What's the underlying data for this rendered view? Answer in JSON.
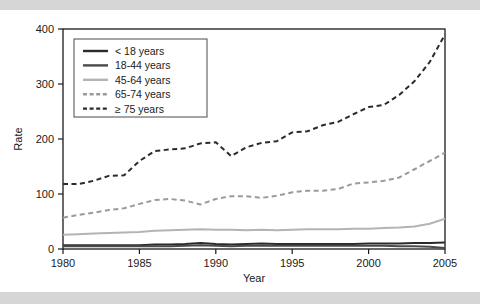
{
  "figure": {
    "y_axis_title": "Rate",
    "x_axis_title": "Year",
    "y_ticks": [
      "0",
      "100",
      "200",
      "300",
      "400"
    ],
    "x_ticks": [
      "1980",
      "1985",
      "1990",
      "1995",
      "2000",
      "2005"
    ]
  },
  "legend": {
    "items": [
      {
        "label": "< 18 years",
        "style": "solid",
        "color": "#2b2b2b"
      },
      {
        "label": "18-44 years",
        "style": "solid",
        "color": "#4a4a4a"
      },
      {
        "label": "45-64 years",
        "style": "solid",
        "color": "#b4b4b4"
      },
      {
        "label": "65-74 years",
        "style": "dashed",
        "color": "#9a9a9a"
      },
      {
        "label": "≥ 75 years",
        "style": "dashed",
        "color": "#2b2b2b"
      }
    ]
  },
  "colors": {
    "background": "#ffffff",
    "band": "#d6d6d6",
    "axis": "#1a1a1a",
    "dark_line": "#2b2b2b",
    "mid_line": "#4a4a4a",
    "light_line": "#b4b4b4",
    "gray_dash": "#9a9a9a"
  },
  "chart_data": {
    "type": "line",
    "title": "",
    "xlabel": "Year",
    "ylabel": "Rate",
    "xlim": [
      1980,
      2005
    ],
    "ylim": [
      0,
      400
    ],
    "grid": false,
    "legend_position": "top-left",
    "x": [
      1980,
      1981,
      1982,
      1983,
      1984,
      1985,
      1986,
      1987,
      1988,
      1989,
      1990,
      1991,
      1992,
      1993,
      1994,
      1995,
      1996,
      1997,
      1998,
      1999,
      2000,
      2001,
      2002,
      2003,
      2004,
      2005
    ],
    "series": [
      {
        "name": "< 18 years",
        "style": "solid",
        "color": "#2b2b2b",
        "values": [
          7,
          7,
          7,
          7,
          7,
          7,
          8,
          8,
          9,
          11,
          9,
          8,
          9,
          10,
          9,
          9,
          9,
          9,
          9,
          9,
          10,
          10,
          10,
          11,
          11,
          12
        ]
      },
      {
        "name": "18-44 years",
        "style": "solid",
        "color": "#4a4a4a",
        "values": [
          5,
          5,
          5,
          5,
          5,
          5,
          5,
          5,
          6,
          7,
          6,
          5,
          6,
          6,
          6,
          6,
          6,
          6,
          6,
          6,
          6,
          6,
          5,
          5,
          4,
          2
        ]
      },
      {
        "name": "45-64 years",
        "style": "solid",
        "color": "#b4b4b4",
        "values": [
          26,
          27,
          28,
          29,
          30,
          31,
          33,
          34,
          35,
          36,
          35,
          35,
          34,
          35,
          34,
          35,
          36,
          36,
          36,
          37,
          37,
          38,
          39,
          41,
          46,
          55
        ]
      },
      {
        "name": "65-74 years",
        "style": "dashed",
        "color": "#9a9a9a",
        "values": [
          57,
          62,
          66,
          71,
          74,
          82,
          89,
          91,
          88,
          81,
          91,
          96,
          96,
          93,
          97,
          103,
          106,
          106,
          109,
          110,
          114,
          116,
          117,
          119,
          121,
          117
        ]
      },
      {
        "name": "≥ 75 years",
        "style": "dashed",
        "color": "#2b2b2b",
        "values": [
          118,
          118,
          124,
          133,
          134,
          160,
          178,
          181,
          183,
          192,
          194,
          169,
          185,
          193,
          196,
          212,
          214,
          207,
          211,
          216,
          213,
          202,
          211,
          213,
          215,
          220
        ]
      }
    ],
    "series_tail_note": {
      "65-74 years": [
        119,
        121,
        124,
        130,
        145,
        160,
        175
      ],
      "≥ 75 years": [
        225,
        231,
        245,
        258,
        262,
        280,
        305,
        340,
        390
      ]
    }
  }
}
